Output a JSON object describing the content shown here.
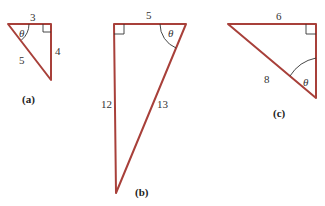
{
  "triangles": [
    {
      "id": "a",
      "caption": "(a)",
      "angle_label": "θ",
      "sides": {
        "top": "3",
        "right": "4",
        "hypotenuse": "5"
      }
    },
    {
      "id": "b",
      "caption": "(b)",
      "angle_label": "θ",
      "sides": {
        "top": "5",
        "left": "12",
        "hypotenuse": "13"
      }
    },
    {
      "id": "c",
      "caption": "(c)",
      "angle_label": "θ",
      "sides": {
        "top": "6",
        "hypotenuse": "8"
      }
    }
  ],
  "colors": {
    "edge": "#a8403a",
    "text": "#333333"
  }
}
